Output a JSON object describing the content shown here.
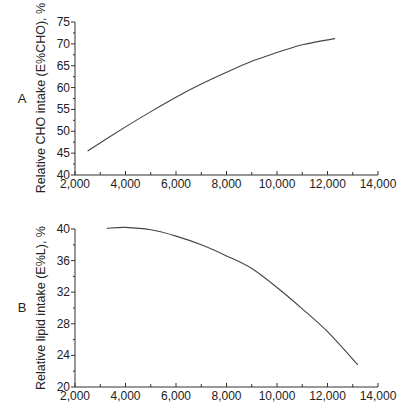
{
  "chart_data": [
    {
      "type": "line",
      "panel": "A",
      "title": "",
      "xlabel": "",
      "ylabel": "Relative CHO intake (E%CHO), %",
      "xlim": [
        2000,
        14000
      ],
      "ylim": [
        40,
        75
      ],
      "x_ticks": [
        "2,000",
        "4,000",
        "6,000",
        "8,000",
        "10,000",
        "12,000",
        "14,000"
      ],
      "y_ticks": [
        "40",
        "45",
        "50",
        "55",
        "60",
        "65",
        "70",
        "75"
      ],
      "grid": false,
      "series": [
        {
          "name": "E%CHO",
          "x": [
            2500,
            4000,
            5000,
            6000,
            7000,
            8000,
            9000,
            10000,
            11000,
            12300
          ],
          "y": [
            45.5,
            51.0,
            54.5,
            57.8,
            60.8,
            63.5,
            66.0,
            68.0,
            69.8,
            71.2
          ]
        }
      ]
    },
    {
      "type": "line",
      "panel": "B",
      "title": "",
      "xlabel": "",
      "ylabel": "Relative lipid intake (E%L), %",
      "xlim": [
        2000,
        14000
      ],
      "ylim": [
        20,
        40
      ],
      "x_ticks": [
        "2,000",
        "4,000",
        "6,000",
        "8,000",
        "10,000",
        "12,000",
        "14,000"
      ],
      "y_ticks": [
        "20",
        "24",
        "28",
        "32",
        "36",
        "40"
      ],
      "grid": false,
      "series": [
        {
          "name": "E%L",
          "x": [
            3250,
            4000,
            5000,
            6000,
            7000,
            8000,
            9000,
            10000,
            11000,
            12000,
            13200
          ],
          "y": [
            40.1,
            40.2,
            39.9,
            39.1,
            38.0,
            36.6,
            35.0,
            32.6,
            29.9,
            27.0,
            22.8
          ]
        }
      ]
    }
  ],
  "panels": {
    "a": {
      "label": "A",
      "ylabel": "Relative CHO intake (E%CHO), %"
    },
    "b": {
      "label": "B",
      "ylabel": "Relative lipid intake (E%L), %"
    }
  }
}
